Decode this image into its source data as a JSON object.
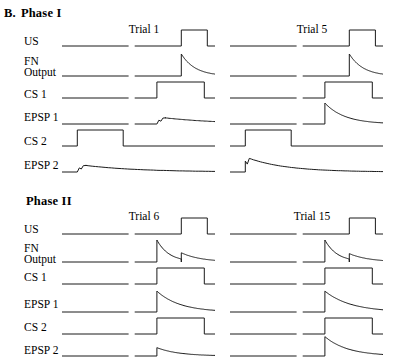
{
  "figure": {
    "panel_letter": "B.",
    "background_color": "#ffffff",
    "trace_color": "#1a1a1a"
  },
  "phases": [
    {
      "id": "phase-1",
      "title": "Phase I",
      "trials": [
        {
          "id": "trial-1",
          "title": "Trial 1"
        },
        {
          "id": "trial-5",
          "title": "Trial 5"
        }
      ]
    },
    {
      "id": "phase-2",
      "title": "Phase II",
      "trials": [
        {
          "id": "trial-6",
          "title": "Trial 6"
        },
        {
          "id": "trial-15",
          "title": "Trial 15"
        }
      ]
    }
  ],
  "row_labels": {
    "us": "US",
    "fn_output_line1": "FN",
    "fn_output_line2": "Output",
    "cs1": "CS 1",
    "epsp1": "EPSP 1",
    "cs2": "CS 2",
    "epsp2": "EPSP 2"
  },
  "chart_data": {
    "type": "line",
    "xlabel": "",
    "ylabel": "",
    "grid": false,
    "legend": "none",
    "signals": [
      "US",
      "FN Output",
      "CS 1",
      "EPSP 1",
      "CS 2",
      "EPSP 2"
    ],
    "panels": [
      {
        "phase": "Phase I",
        "trial": "Trial 1",
        "traces": [
          {
            "signal": "US",
            "shape": "square-pulse",
            "onset": 0.78,
            "offset": 0.95,
            "amplitude": 1.0
          },
          {
            "signal": "FN Output",
            "shape": "spike-decay",
            "onset": 0.78,
            "amplitude": 1.0,
            "decay": 0.09
          },
          {
            "signal": "CS 1",
            "shape": "square-pulse",
            "onset": 0.62,
            "offset": 0.93,
            "amplitude": 1.0
          },
          {
            "signal": "EPSP 1",
            "shape": "small-bump-slow-decay",
            "onset": 0.62,
            "amplitude": 0.28,
            "decay": 0.35
          },
          {
            "signal": "CS 2",
            "shape": "square-pulse",
            "onset": 0.1,
            "offset": 0.4,
            "amplitude": 1.0
          },
          {
            "signal": "EPSP 2",
            "shape": "small-bump-slow-decay",
            "onset": 0.1,
            "amplitude": 0.3,
            "decay": 0.35
          }
        ]
      },
      {
        "phase": "Phase I",
        "trial": "Trial 5",
        "traces": [
          {
            "signal": "US",
            "shape": "square-pulse",
            "onset": 0.78,
            "offset": 0.95,
            "amplitude": 1.0
          },
          {
            "signal": "FN Output",
            "shape": "spike-decay",
            "onset": 0.78,
            "amplitude": 1.0,
            "decay": 0.09
          },
          {
            "signal": "CS 1",
            "shape": "square-pulse",
            "onset": 0.62,
            "offset": 0.93,
            "amplitude": 1.0
          },
          {
            "signal": "EPSP 1",
            "shape": "large-spike-decay",
            "onset": 0.62,
            "amplitude": 0.95,
            "decay": 0.13
          },
          {
            "signal": "CS 2",
            "shape": "square-pulse",
            "onset": 0.1,
            "offset": 0.4,
            "amplitude": 1.0
          },
          {
            "signal": "EPSP 2",
            "shape": "medium-spike-slow-decay",
            "onset": 0.1,
            "amplitude": 0.62,
            "decay": 0.25
          }
        ]
      },
      {
        "phase": "Phase II",
        "trial": "Trial 6",
        "traces": [
          {
            "signal": "US",
            "shape": "square-pulse",
            "onset": 0.78,
            "offset": 0.95,
            "amplitude": 1.0
          },
          {
            "signal": "FN Output",
            "shape": "double-spike",
            "spike1_onset": 0.62,
            "spike1_amplitude": 1.0,
            "spike2_onset": 0.78,
            "spike2_amplitude": 0.42,
            "decay": 0.08
          },
          {
            "signal": "CS 1",
            "shape": "square-pulse",
            "onset": 0.62,
            "offset": 0.93,
            "amplitude": 1.0
          },
          {
            "signal": "EPSP 1",
            "shape": "large-spike-decay",
            "onset": 0.62,
            "amplitude": 0.95,
            "decay": 0.15
          },
          {
            "signal": "CS 2",
            "shape": "square-pulse",
            "onset": 0.62,
            "offset": 0.93,
            "amplitude": 1.0
          },
          {
            "signal": "EPSP 2",
            "shape": "small-spike-decay",
            "onset": 0.62,
            "amplitude": 0.38,
            "decay": 0.14
          }
        ]
      },
      {
        "phase": "Phase II",
        "trial": "Trial 15",
        "traces": [
          {
            "signal": "US",
            "shape": "square-pulse",
            "onset": 0.78,
            "offset": 0.95,
            "amplitude": 1.0
          },
          {
            "signal": "FN Output",
            "shape": "double-spike",
            "spike1_onset": 0.62,
            "spike1_amplitude": 1.0,
            "spike2_onset": 0.78,
            "spike2_amplitude": 0.38,
            "decay": 0.08
          },
          {
            "signal": "CS 1",
            "shape": "square-pulse",
            "onset": 0.62,
            "offset": 0.93,
            "amplitude": 1.0
          },
          {
            "signal": "EPSP 1",
            "shape": "large-spike-decay",
            "onset": 0.62,
            "amplitude": 0.95,
            "decay": 0.17
          },
          {
            "signal": "CS 2",
            "shape": "square-pulse",
            "onset": 0.62,
            "offset": 0.93,
            "amplitude": 1.0
          },
          {
            "signal": "EPSP 2",
            "shape": "large-spike-decay",
            "onset": 0.62,
            "amplitude": 0.88,
            "decay": 0.15
          }
        ]
      }
    ]
  }
}
